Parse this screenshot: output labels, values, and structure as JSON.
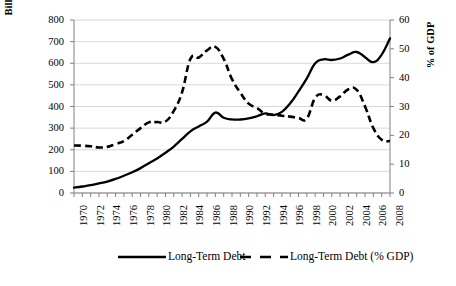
{
  "chart_data": {
    "type": "line",
    "title": "",
    "xlabel": "",
    "ylabel": "Billions US Current Dollars",
    "y2label": "% of GDP",
    "grid": true,
    "legend_position": "bottom",
    "xlim": [
      1970,
      2008
    ],
    "ylim": [
      0,
      800
    ],
    "y2lim": [
      0,
      60
    ],
    "ytick_labels": [
      "800",
      "700",
      "600",
      "500",
      "400",
      "300",
      "200",
      "100",
      "0"
    ],
    "ytick_values": [
      800,
      700,
      600,
      500,
      400,
      300,
      200,
      100,
      0
    ],
    "y2tick_labels": [
      "60",
      "50",
      "40",
      "30",
      "20",
      "10",
      "0"
    ],
    "y2tick_values": [
      60,
      50,
      40,
      30,
      20,
      10,
      0
    ],
    "xtick_labels": [
      "1970",
      "1972",
      "1974",
      "1976",
      "1978",
      "1980",
      "1982",
      "1984",
      "1986",
      "1988",
      "1990",
      "1992",
      "1994",
      "1996",
      "1998",
      "2000",
      "2002",
      "2004",
      "2006",
      "2008"
    ],
    "x": [
      1970,
      1971,
      1972,
      1973,
      1974,
      1975,
      1976,
      1977,
      1978,
      1979,
      1980,
      1981,
      1982,
      1983,
      1984,
      1985,
      1986,
      1987,
      1988,
      1989,
      1990,
      1991,
      1992,
      1993,
      1994,
      1995,
      1996,
      1997,
      1998,
      1999,
      2000,
      2001,
      2002,
      2003,
      2004,
      2005,
      2006,
      2007,
      2008
    ],
    "series": [
      {
        "name": "Long-Term Debt",
        "axis": "left",
        "style": "solid",
        "color": "#000000",
        "values": [
          25,
          30,
          36,
          44,
          53,
          65,
          80,
          96,
          115,
          138,
          160,
          186,
          215,
          250,
          285,
          308,
          330,
          372,
          348,
          340,
          340,
          345,
          355,
          368,
          360,
          375,
          415,
          470,
          530,
          600,
          618,
          615,
          622,
          640,
          652,
          628,
          605,
          640,
          715
        ]
      },
      {
        "name": "Long-Term Debt (% GDP)",
        "axis": "right",
        "style": "dashed",
        "color": "#000000",
        "values": [
          16.5,
          16.4,
          16.2,
          15.8,
          16.0,
          17.0,
          18.0,
          20.2,
          22.5,
          24.5,
          24.6,
          24.8,
          28.5,
          35.0,
          46.5,
          47.0,
          49.5,
          50.7,
          46.5,
          39.5,
          34.8,
          31.0,
          29.5,
          27.5,
          27.2,
          26.8,
          26.5,
          26.0,
          25.8,
          33.0,
          34.0,
          32.0,
          33.5,
          36.0,
          35.8,
          30.0,
          22.5,
          18.5,
          18.0
        ]
      }
    ],
    "legend": [
      {
        "label": "Long-Term Debt",
        "style": "solid"
      },
      {
        "label": "Long-Term Debt (% GDP)",
        "style": "dashed"
      }
    ]
  }
}
